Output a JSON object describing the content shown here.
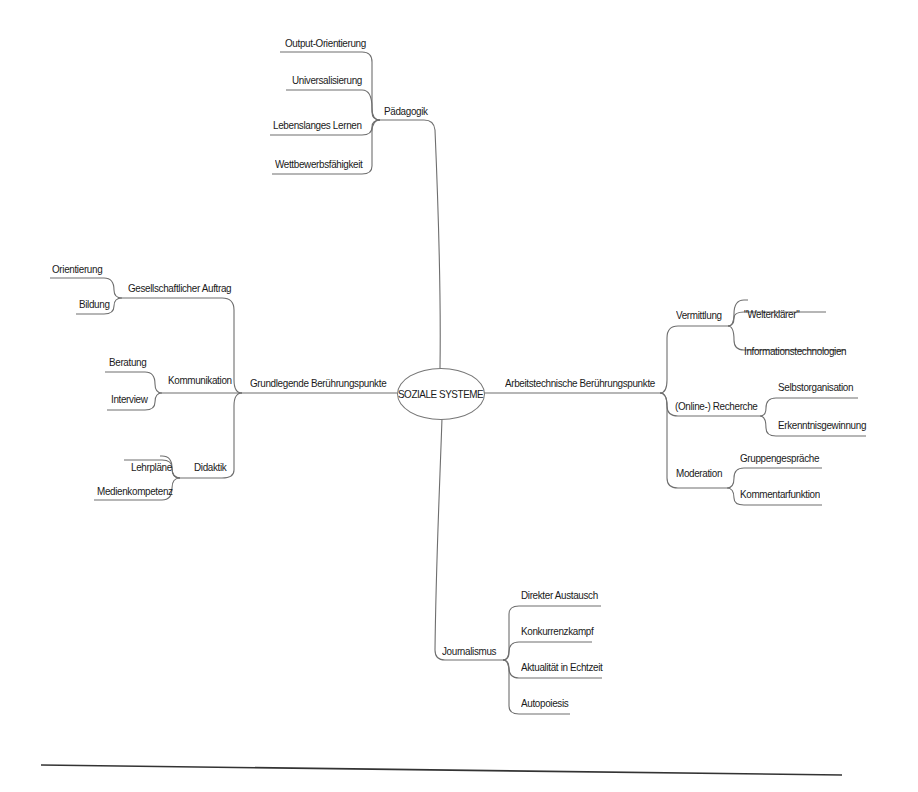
{
  "mindmap": {
    "center": "SOZIALE SYSTEME",
    "branches": [
      {
        "label": "Pädagogik",
        "children": [
          "Output-Orientierung",
          "Universalisierung",
          "Lebenslanges Lernen",
          "Wettbewerbsfähigkeit"
        ]
      },
      {
        "label": "Grundlegende Berührungspunkte",
        "children": [
          {
            "label": "Gesellschaftlicher Auftrag",
            "children": [
              "Orientierung",
              "Bildung"
            ]
          },
          {
            "label": "Kommunikation",
            "children": [
              "Beratung",
              "Interview"
            ]
          },
          {
            "label": "Didaktik",
            "children": [
              "Lehrpläne",
              "Medienkompetenz"
            ]
          }
        ]
      },
      {
        "label": "Arbeitstechnische Berührungspunkte",
        "children": [
          {
            "label": "Vermittlung",
            "children": [
              "\"Welterklärer\"",
              "Informationstechnologien"
            ]
          },
          {
            "label": "(Online-) Recherche",
            "children": [
              "Selbstorganisation",
              "Erkenntnisgewinnung"
            ]
          },
          {
            "label": "Moderation",
            "children": [
              "Gruppengespräche",
              "Kommentarfunktion"
            ]
          }
        ]
      },
      {
        "label": "Journalismus",
        "children": [
          "Direkter Austausch",
          "Konkurrenzkampf",
          "Aktualität in Echtzeit",
          "Autopoiesis"
        ]
      }
    ]
  },
  "colors": {
    "line": "#6e6e6e",
    "text": "#1a1a1a",
    "rule": "#333333"
  }
}
